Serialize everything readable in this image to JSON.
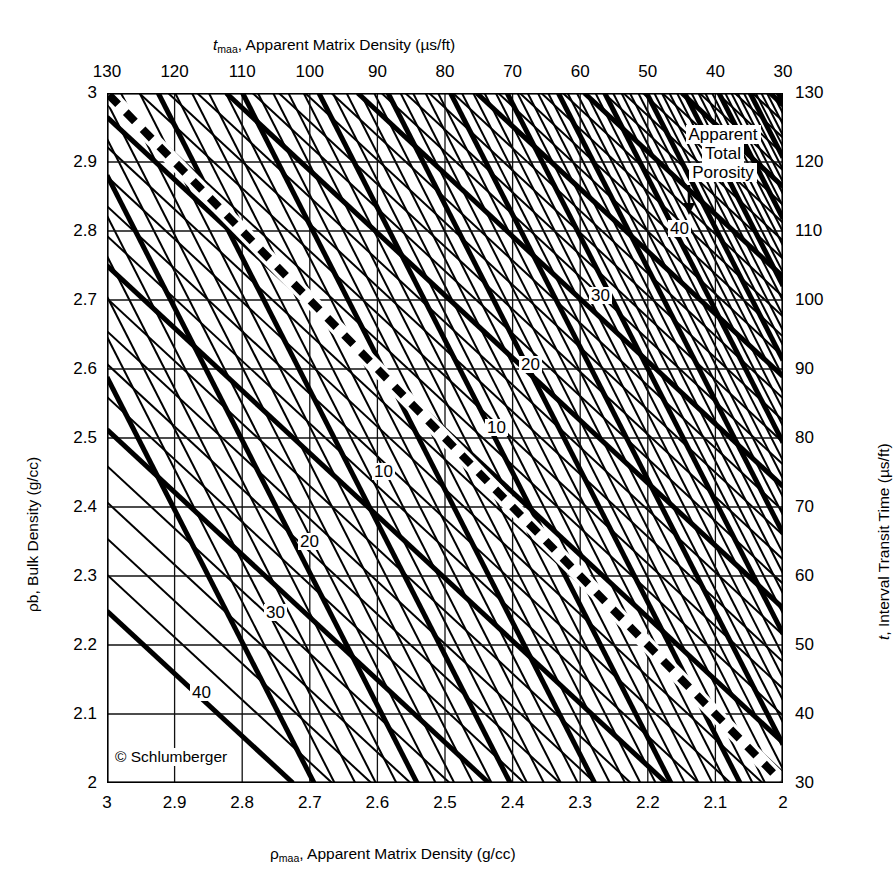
{
  "chart_data": {
    "type": "line",
    "title": "",
    "subtitle": "",
    "credit": "© Schlumberger",
    "axes": {
      "top": {
        "label_html": "t_maa, Apparent Matrix Density (µs/ft)",
        "label_symbol": "t",
        "label_sub": "maa",
        "label_rest": ", Apparent Matrix Density (µs/ft)",
        "ticks": [
          130,
          120,
          110,
          100,
          90,
          80,
          70,
          60,
          50,
          40,
          30
        ],
        "range": [
          130,
          30
        ],
        "direction": "decreasing-left-to-right"
      },
      "bottom": {
        "label_symbol": "ρ",
        "label_sub": "maa",
        "label_rest": ", Apparent Matrix Density (g/cc)",
        "ticks": [
          "3",
          "2.9",
          "2.8",
          "2.7",
          "2.6",
          "2.5",
          "2.4",
          "2.3",
          "2.2",
          "2.1",
          "2"
        ],
        "range": [
          3,
          2
        ],
        "direction": "decreasing-left-to-right"
      },
      "left": {
        "label_symbol": "ρb",
        "label_rest": ", Bulk Density (g/cc)",
        "ticks": [
          "3",
          "2.9",
          "2.8",
          "2.7",
          "2.6",
          "2.5",
          "2.4",
          "2.3",
          "2.2",
          "2.1",
          "2"
        ],
        "range": [
          3,
          2
        ],
        "direction": "decreasing-top-to-bottom"
      },
      "right": {
        "label_symbol": "t",
        "label_rest": ", Interval Transit Time (µs/ft)",
        "ticks": [
          130,
          120,
          110,
          100,
          90,
          80,
          70,
          60,
          50,
          40,
          30
        ],
        "range": [
          130,
          30
        ],
        "direction": "decreasing-top-to-bottom"
      }
    },
    "grid": {
      "enabled": true,
      "x_divisions": 10,
      "y_divisions": 10
    },
    "annotations": [
      {
        "id": "apparent-total-porosity",
        "lines": [
          "Apparent",
          "Total",
          "Porosity"
        ],
        "arrow": "down",
        "points_to": "40"
      }
    ],
    "series": [
      {
        "name": "Apparent Total Porosity (sonic family, steep)",
        "style": "solid",
        "major_interval": 10,
        "minor_interval": 2,
        "labels": [
          {
            "value": "40",
            "x_px": 668,
            "y_px": 220
          },
          {
            "value": "30",
            "x_px": 589,
            "y_px": 287
          },
          {
            "value": "20",
            "x_px": 519,
            "y_px": 356
          },
          {
            "value": "10",
            "x_px": 485,
            "y_px": 419
          }
        ]
      },
      {
        "name": "Apparent Total Porosity (density family, shallow)",
        "style": "solid",
        "major_interval": 10,
        "minor_interval": 2,
        "labels": [
          {
            "value": "10",
            "x_px": 372,
            "y_px": 463
          },
          {
            "value": "20",
            "x_px": 298,
            "y_px": 533
          },
          {
            "value": "30",
            "x_px": 264,
            "y_px": 604
          },
          {
            "value": "40",
            "x_px": 190,
            "y_px": 684
          }
        ]
      },
      {
        "name": "Dashed reference line (top-left to bottom-right)",
        "style": "dashed",
        "from": {
          "x": 3.0,
          "y": 3.0
        },
        "to": {
          "x": 2.0,
          "y": 2.0
        }
      }
    ],
    "colors": {
      "ink": "#000000",
      "background": "#ffffff",
      "grid": "#1a1a1a"
    }
  },
  "annotation": {
    "line1": "Apparent",
    "line2": "Total",
    "line3": "Porosity"
  },
  "credit": {
    "text": "© Schlumberger"
  }
}
